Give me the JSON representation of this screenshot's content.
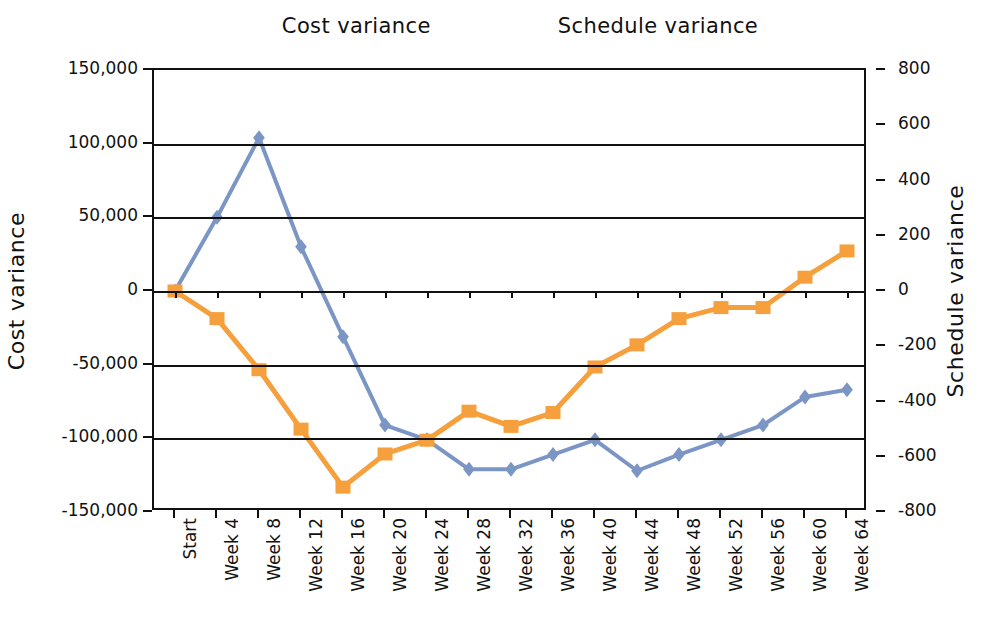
{
  "legend": {
    "items": [
      {
        "label": "Cost variance",
        "color": "#7B96C4",
        "marker": "diamond-marker-icon"
      },
      {
        "label": "Schedule variance",
        "color": "#F5A03C",
        "marker": "square-marker-icon"
      }
    ]
  },
  "axes": {
    "left_title": "Cost variance",
    "right_title": "Schedule variance",
    "left_ticks": [
      "150,000",
      "100,000",
      "50,000",
      "0",
      "-50,000",
      "-100,000",
      "-150,000"
    ],
    "right_ticks": [
      "800",
      "600",
      "400",
      "200",
      "0",
      "-200",
      "-400",
      "-600",
      "-800"
    ]
  },
  "chart_data": {
    "type": "line",
    "title": "",
    "xlabel": "",
    "ylabel": "Cost variance",
    "y2label": "Schedule variance",
    "ylim": [
      -150000,
      150000
    ],
    "y2lim": [
      -800,
      800
    ],
    "grid": true,
    "legend_position": "top-center",
    "categories": [
      "Start",
      "Week 4",
      "Week 8",
      "Week 12",
      "Week 16",
      "Week 20",
      "Week 24",
      "Week 28",
      "Week 32",
      "Week 36",
      "Week 40",
      "Week 44",
      "Week 48",
      "Week 52",
      "Week 56",
      "Week 60",
      "Week 64"
    ],
    "series": [
      {
        "name": "Cost variance",
        "axis": "left",
        "color": "#7B96C4",
        "marker": "diamond",
        "values": [
          0,
          50000,
          104000,
          30000,
          -31000,
          -91000,
          -101000,
          -121000,
          -121000,
          -111000,
          -101000,
          -122000,
          -111000,
          -101000,
          -91000,
          -72000,
          -67000
        ]
      },
      {
        "name": "Schedule variance",
        "axis": "right",
        "color": "#F5A03C",
        "marker": "square",
        "values": [
          0,
          -100,
          -285,
          -500,
          -710,
          -590,
          -540,
          -435,
          -490,
          -440,
          -275,
          -195,
          -100,
          -60,
          -60,
          50,
          145
        ]
      }
    ]
  }
}
